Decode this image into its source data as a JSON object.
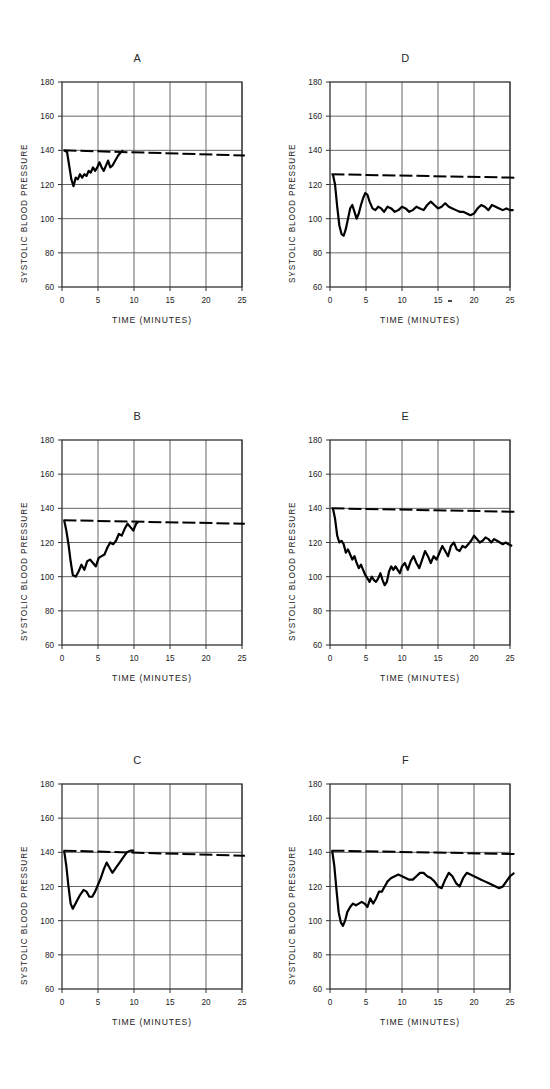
{
  "figure": {
    "title": "",
    "panel_count": 6,
    "axis": {
      "xlabel": "TIME  (MINUTES)",
      "ylabel": "SYSTOLIC BLOOD PRESSURE",
      "xlim": [
        0,
        25
      ],
      "ylim": [
        60,
        180
      ],
      "xticks": [
        "0",
        "5",
        "10",
        "15",
        "20",
        "25"
      ],
      "yticks": [
        "60",
        "80",
        "100",
        "120",
        "140",
        "160",
        "180"
      ],
      "xtick_values": [
        0,
        5,
        10,
        15,
        20,
        25
      ],
      "ytick_values": [
        60,
        80,
        100,
        120,
        140,
        160,
        180
      ],
      "grid": true
    },
    "colors": {
      "trace": "#000000",
      "baseline": "#000000",
      "grid": "#555555",
      "frame": "#333333",
      "background": "#ffffff"
    }
  },
  "chart_data": [
    {
      "type": "line",
      "panel": "A",
      "title": "A",
      "xlabel": "TIME  (MINUTES)",
      "ylabel": "SYSTOLIC BLOOD PRESSURE",
      "xlim": [
        0,
        25
      ],
      "ylim": [
        60,
        180
      ],
      "grid": true,
      "series": [
        {
          "name": "control baseline",
          "style": "dashed",
          "x": [
            0.2,
            25.4
          ],
          "values": [
            140,
            137
          ]
        },
        {
          "name": "systolic blood pressure",
          "style": "solid",
          "x": [
            0.3,
            0.7,
            1.0,
            1.3,
            1.6,
            1.9,
            2.2,
            2.5,
            2.8,
            3.1,
            3.4,
            3.7,
            4.0,
            4.3,
            4.6,
            4.9,
            5.2,
            5.5,
            5.8,
            6.1,
            6.4,
            6.7,
            7.0,
            7.4,
            7.8,
            8.2,
            8.5
          ],
          "values": [
            140,
            139,
            131,
            123,
            119,
            124,
            123,
            126,
            124,
            126,
            125,
            128,
            127,
            130,
            128,
            130,
            133,
            130,
            128,
            131,
            134,
            130,
            131,
            134,
            137,
            139,
            140
          ]
        }
      ]
    },
    {
      "type": "line",
      "panel": "B",
      "title": "B",
      "xlabel": "TIME  (MINUTES)",
      "ylabel": "SYSTOLIC BLOOD PRESSURE",
      "xlim": [
        0,
        25
      ],
      "ylim": [
        60,
        180
      ],
      "grid": true,
      "series": [
        {
          "name": "control baseline",
          "style": "dashed",
          "x": [
            0.2,
            25.4
          ],
          "values": [
            133,
            131
          ]
        },
        {
          "name": "systolic blood pressure",
          "style": "solid",
          "x": [
            0.3,
            0.6,
            0.9,
            1.2,
            1.5,
            1.9,
            2.3,
            2.7,
            3.1,
            3.5,
            3.9,
            4.3,
            4.7,
            5.1,
            5.5,
            5.9,
            6.3,
            6.7,
            7.1,
            7.5,
            7.9,
            8.3,
            8.7,
            9.1,
            9.5,
            9.9,
            10.3,
            10.6
          ],
          "values": [
            133,
            127,
            119,
            109,
            101,
            100,
            103,
            107,
            104,
            109,
            110,
            108,
            106,
            111,
            112,
            113,
            117,
            120,
            119,
            121,
            125,
            124,
            128,
            131,
            129,
            127,
            131,
            132
          ]
        }
      ]
    },
    {
      "type": "line",
      "panel": "C",
      "title": "C",
      "xlabel": "TIME  (MINUTES)",
      "ylabel": "SYSTOLIC BLOOD PRESSURE",
      "xlim": [
        0,
        25
      ],
      "ylim": [
        60,
        180
      ],
      "grid": true,
      "series": [
        {
          "name": "control baseline",
          "style": "dashed",
          "x": [
            0.2,
            25.4
          ],
          "values": [
            141,
            138
          ]
        },
        {
          "name": "systolic blood pressure",
          "style": "solid",
          "x": [
            0.3,
            0.6,
            0.9,
            1.2,
            1.5,
            2.0,
            2.5,
            3.0,
            3.4,
            3.8,
            4.2,
            4.6,
            5.0,
            5.4,
            5.8,
            6.2,
            6.6,
            7.0,
            7.5,
            8.0,
            8.5,
            9.0,
            9.5,
            10.0
          ],
          "values": [
            141,
            132,
            120,
            110,
            107,
            111,
            115,
            118,
            117,
            114,
            114,
            117,
            121,
            125,
            130,
            134,
            131,
            128,
            131,
            134,
            137,
            140,
            141,
            141
          ]
        }
      ]
    },
    {
      "type": "line",
      "panel": "D",
      "title": "D",
      "xlabel": "TIME  (MINUTES)",
      "ylabel": "SYSTOLIC BLOOD PRESSURE",
      "xlim": [
        0,
        25
      ],
      "ylim": [
        60,
        180
      ],
      "grid": true,
      "series": [
        {
          "name": "control baseline",
          "style": "dashed",
          "x": [
            0.2,
            25.6
          ],
          "values": [
            126,
            124
          ]
        },
        {
          "name": "systolic blood pressure",
          "style": "solid",
          "x": [
            0.4,
            0.7,
            1.0,
            1.3,
            1.6,
            1.9,
            2.2,
            2.5,
            2.8,
            3.1,
            3.4,
            3.7,
            4.0,
            4.3,
            4.6,
            4.9,
            5.2,
            5.5,
            5.9,
            6.3,
            6.7,
            7.1,
            7.5,
            8.0,
            8.5,
            9.0,
            9.5,
            10.0,
            10.5,
            11.0,
            11.5,
            12.0,
            12.5,
            13.0,
            13.5,
            14.0,
            14.5,
            15.0,
            15.5,
            16.0,
            16.5,
            17.0,
            17.5,
            18.0,
            18.5,
            19.0,
            19.5,
            20.0,
            20.5,
            21.0,
            21.5,
            22.0,
            22.5,
            23.0,
            23.5,
            24.0,
            24.5,
            25.0,
            25.5
          ],
          "values": [
            126,
            120,
            107,
            96,
            91,
            90,
            94,
            100,
            106,
            108,
            104,
            100,
            103,
            108,
            112,
            115,
            114,
            110,
            106,
            105,
            107,
            106,
            104,
            107,
            106,
            104,
            105,
            107,
            106,
            104,
            105,
            107,
            106,
            105,
            108,
            110,
            108,
            106,
            107,
            109,
            107,
            106,
            105,
            104,
            104,
            103,
            102,
            103,
            106,
            108,
            107,
            105,
            108,
            107,
            106,
            105,
            106,
            105,
            105
          ]
        }
      ]
    },
    {
      "type": "line",
      "panel": "E",
      "title": "E",
      "xlabel": "TIME  (MINUTES)",
      "ylabel": "SYSTOLIC BLOOD PRESSURE",
      "xlim": [
        0,
        25
      ],
      "ylim": [
        60,
        180
      ],
      "grid": true,
      "series": [
        {
          "name": "control baseline",
          "style": "dashed",
          "x": [
            0.2,
            25.6
          ],
          "values": [
            140,
            138
          ]
        },
        {
          "name": "systolic blood pressure",
          "style": "solid",
          "x": [
            0.4,
            0.7,
            1.0,
            1.3,
            1.6,
            1.9,
            2.2,
            2.5,
            2.8,
            3.1,
            3.4,
            3.7,
            4.0,
            4.3,
            4.6,
            4.9,
            5.2,
            5.5,
            5.8,
            6.1,
            6.4,
            6.7,
            7.0,
            7.3,
            7.6,
            7.9,
            8.2,
            8.5,
            8.8,
            9.1,
            9.4,
            9.7,
            10.0,
            10.4,
            10.8,
            11.2,
            11.6,
            12.0,
            12.4,
            12.8,
            13.2,
            13.6,
            14.0,
            14.4,
            14.8,
            15.2,
            15.6,
            16.0,
            16.4,
            16.8,
            17.2,
            17.6,
            18.0,
            18.4,
            18.8,
            19.2,
            19.6,
            20.0,
            20.4,
            20.8,
            21.2,
            21.6,
            22.0,
            22.4,
            22.8,
            23.2,
            23.6,
            24.0,
            24.4,
            24.8,
            25.3
          ],
          "values": [
            140,
            134,
            124,
            120,
            121,
            119,
            114,
            116,
            113,
            110,
            112,
            108,
            105,
            107,
            104,
            101,
            99,
            97,
            100,
            98,
            97,
            99,
            102,
            98,
            95,
            97,
            103,
            106,
            104,
            106,
            104,
            102,
            106,
            108,
            104,
            109,
            112,
            108,
            105,
            110,
            115,
            112,
            108,
            112,
            110,
            114,
            118,
            115,
            112,
            118,
            120,
            116,
            115,
            118,
            117,
            119,
            121,
            124,
            122,
            120,
            121,
            123,
            122,
            120,
            122,
            121,
            120,
            119,
            120,
            119,
            118
          ]
        }
      ]
    },
    {
      "type": "line",
      "panel": "F",
      "title": "F",
      "xlabel": "TIME  (MINUTES)",
      "ylabel": "SYSTOLIC BLOOD PRESSURE",
      "xlim": [
        0,
        25
      ],
      "ylim": [
        60,
        180
      ],
      "grid": true,
      "series": [
        {
          "name": "control baseline",
          "style": "dashed",
          "x": [
            0.2,
            25.8
          ],
          "values": [
            141,
            139
          ]
        },
        {
          "name": "systolic blood pressure",
          "style": "solid",
          "x": [
            0.3,
            0.6,
            0.9,
            1.2,
            1.5,
            1.8,
            2.1,
            2.4,
            2.8,
            3.2,
            3.6,
            4.0,
            4.4,
            4.8,
            5.2,
            5.6,
            6.0,
            6.4,
            6.8,
            7.2,
            7.6,
            8.0,
            8.5,
            9.0,
            9.5,
            10.0,
            10.5,
            11.0,
            11.5,
            12.0,
            12.5,
            13.0,
            13.5,
            14.0,
            14.5,
            15.0,
            15.5,
            16.0,
            16.5,
            17.0,
            17.5,
            18.0,
            18.5,
            19.0,
            19.5,
            20.0,
            20.5,
            21.0,
            21.5,
            22.0,
            22.5,
            23.0,
            23.5,
            24.0,
            24.5,
            25.0,
            25.6
          ],
          "values": [
            141,
            132,
            118,
            105,
            99,
            97,
            100,
            105,
            108,
            110,
            109,
            110,
            111,
            110,
            108,
            113,
            110,
            113,
            117,
            117,
            120,
            123,
            125,
            126,
            127,
            126,
            125,
            124,
            124,
            126,
            128,
            128,
            126,
            125,
            123,
            120,
            119,
            124,
            128,
            126,
            122,
            120,
            125,
            128,
            127,
            126,
            125,
            124,
            123,
            122,
            121,
            120,
            119,
            120,
            123,
            126,
            128
          ]
        }
      ]
    }
  ],
  "artifacts": {
    "panel_d_tick_mark": "•"
  }
}
